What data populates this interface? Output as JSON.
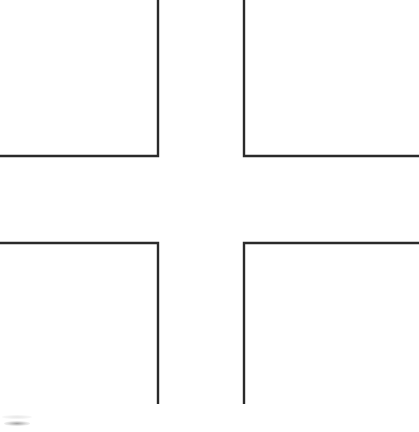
{
  "figure": {
    "caption": "Cross formed by four L-shaped corner brackets",
    "background_color": "#ffffff",
    "stroke_color": "#2a2a2a",
    "stroke_width_px": 2.4,
    "canvas_width_px": 419,
    "canvas_height_px": 432
  },
  "chart_data": {
    "type": "line",
    "xlabel": "",
    "ylabel": "",
    "xlim": [
      0,
      419
    ],
    "ylim": [
      0,
      432
    ],
    "grid": false,
    "legend": "none",
    "series": [
      {
        "name": "top-left-bracket",
        "points": [
          [
            158,
            0
          ],
          [
            158,
            156
          ],
          [
            0,
            156
          ]
        ]
      },
      {
        "name": "top-right-bracket",
        "points": [
          [
            244,
            0
          ],
          [
            244,
            156
          ],
          [
            419,
            156
          ]
        ]
      },
      {
        "name": "bottom-left-bracket",
        "points": [
          [
            0,
            243
          ],
          [
            158,
            243
          ],
          [
            158,
            404
          ]
        ]
      },
      {
        "name": "bottom-right-bracket",
        "points": [
          [
            419,
            243
          ],
          [
            244,
            243
          ],
          [
            244,
            404
          ]
        ]
      }
    ],
    "annotations": [
      {
        "name": "scan-smudge",
        "x": 16,
        "y": 424,
        "label": ""
      }
    ]
  },
  "geometry": {
    "left_vertical_x": 158,
    "right_vertical_x": 244,
    "top_horizontal_y": 156,
    "bottom_horizontal_y": 243,
    "vertical_top_y": 0,
    "vertical_bottom_y": 404,
    "horizontal_left_x": 0,
    "horizontal_right_x": 419,
    "gap_width_px": 86,
    "gap_height_px": 87
  }
}
